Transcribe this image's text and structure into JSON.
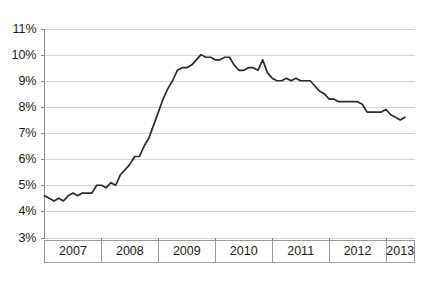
{
  "chart_data": {
    "type": "line",
    "title": "",
    "subtitle": "",
    "xlabel": "",
    "ylabel": "",
    "ylim": [
      3,
      11
    ],
    "yticks": [
      3,
      4,
      5,
      6,
      7,
      8,
      9,
      10,
      11
    ],
    "ytick_labels": [
      "3%",
      "4%",
      "5%",
      "6%",
      "7%",
      "8%",
      "9%",
      "10%",
      "11%"
    ],
    "xlim": [
      2007.0,
      2013.5
    ],
    "xtick_labels": [
      "2007",
      "2008",
      "2009",
      "2010",
      "2011",
      "2012",
      "2013"
    ],
    "xband_starts": [
      2007.0,
      2008.0,
      2009.0,
      2010.0,
      2011.0,
      2012.0,
      2013.0
    ],
    "grid": "horizontal",
    "legend": "none",
    "line_color": "#2b2b2b",
    "grid_color": "#d4d4d4",
    "axis_color": "#8c8c8c",
    "background_color": "#ffffff",
    "series": [
      {
        "name": "Unemployment rate",
        "x": [
          2007.0,
          2007.083,
          2007.167,
          2007.25,
          2007.333,
          2007.417,
          2007.5,
          2007.583,
          2007.667,
          2007.75,
          2007.833,
          2007.917,
          2008.0,
          2008.083,
          2008.167,
          2008.25,
          2008.333,
          2008.417,
          2008.5,
          2008.583,
          2008.667,
          2008.75,
          2008.833,
          2008.917,
          2009.0,
          2009.083,
          2009.167,
          2009.25,
          2009.333,
          2009.417,
          2009.5,
          2009.583,
          2009.667,
          2009.75,
          2009.833,
          2009.917,
          2010.0,
          2010.083,
          2010.167,
          2010.25,
          2010.333,
          2010.417,
          2010.5,
          2010.583,
          2010.667,
          2010.75,
          2010.833,
          2010.917,
          2011.0,
          2011.083,
          2011.167,
          2011.25,
          2011.333,
          2011.417,
          2011.5,
          2011.583,
          2011.667,
          2011.75,
          2011.833,
          2011.917,
          2012.0,
          2012.083,
          2012.167,
          2012.25,
          2012.333,
          2012.417,
          2012.5,
          2012.583,
          2012.667,
          2012.75,
          2012.833,
          2012.917,
          2013.0,
          2013.083,
          2013.167,
          2013.25,
          2013.333
        ],
        "values": [
          4.6,
          4.5,
          4.4,
          4.5,
          4.4,
          4.6,
          4.7,
          4.6,
          4.7,
          4.7,
          4.7,
          5.0,
          5.0,
          4.9,
          5.1,
          5.0,
          5.4,
          5.6,
          5.8,
          6.1,
          6.1,
          6.5,
          6.8,
          7.3,
          7.8,
          8.3,
          8.7,
          9.0,
          9.4,
          9.5,
          9.5,
          9.6,
          9.8,
          10.0,
          9.9,
          9.9,
          9.8,
          9.8,
          9.9,
          9.9,
          9.6,
          9.4,
          9.4,
          9.5,
          9.5,
          9.4,
          9.8,
          9.3,
          9.1,
          9.0,
          9.0,
          9.1,
          9.0,
          9.1,
          9.0,
          9.0,
          9.0,
          8.8,
          8.6,
          8.5,
          8.3,
          8.3,
          8.2,
          8.2,
          8.2,
          8.2,
          8.2,
          8.1,
          7.8,
          7.8,
          7.8,
          7.8,
          7.9,
          7.7,
          7.6,
          7.5,
          7.6
        ]
      }
    ]
  }
}
